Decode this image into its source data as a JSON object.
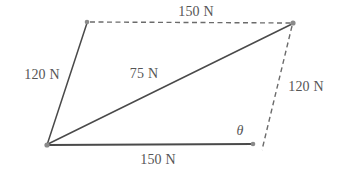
{
  "figure": {
    "type": "parallelogram-force-diagram",
    "canvas": {
      "width": 337,
      "height": 175,
      "background": "#ffffff"
    },
    "colors": {
      "solid_line": "#4a4a4a",
      "dashed_line": "#6b6b6b",
      "vertex_dot": "#8a8a8a",
      "text": "#555555"
    },
    "vertices": [
      {
        "name": "bottom-left",
        "x": 47,
        "y": 145
      },
      {
        "name": "top-left",
        "x": 87,
        "y": 22
      },
      {
        "name": "top-right",
        "x": 293,
        "y": 23
      },
      {
        "name": "bottom-right",
        "x": 253,
        "y": 144
      }
    ],
    "edges": [
      {
        "name": "left-side",
        "style": "solid",
        "from": "top-left",
        "to": "bottom-left",
        "label": "120 N"
      },
      {
        "name": "top-side",
        "style": "dashed",
        "from": "top-left",
        "to": "top-right",
        "label": "150 N"
      },
      {
        "name": "right-side",
        "style": "dashed",
        "from": "top-right",
        "to": "bottom-right",
        "label": "120 N"
      },
      {
        "name": "bottom-side",
        "style": "solid",
        "from": "bottom-left",
        "to": "bottom-right",
        "label": "150 N"
      },
      {
        "name": "diagonal",
        "style": "solid",
        "from": "bottom-left",
        "to": "top-right",
        "label": "75 N"
      }
    ],
    "labels": [
      {
        "id": "top",
        "text": "150 N",
        "x": 196,
        "y": 12
      },
      {
        "id": "left",
        "text": "120 N",
        "x": 42,
        "y": 75
      },
      {
        "id": "diagonal",
        "text": "75 N",
        "x": 144,
        "y": 74
      },
      {
        "id": "right",
        "text": "120 N",
        "x": 306,
        "y": 87
      },
      {
        "id": "bottom",
        "text": "150 N",
        "x": 158,
        "y": 160
      },
      {
        "id": "angle",
        "text": "θ",
        "x": 240,
        "y": 131
      }
    ]
  }
}
